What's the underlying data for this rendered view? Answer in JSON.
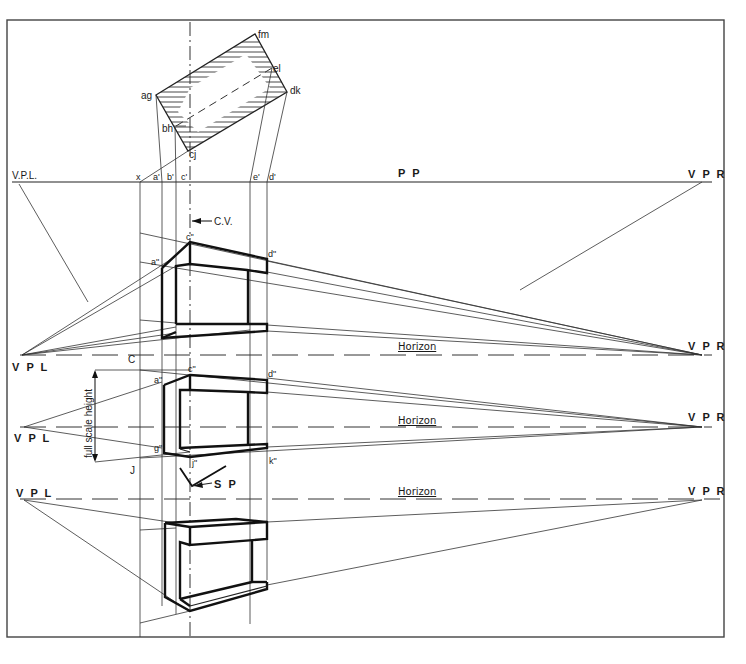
{
  "diagram": {
    "type": "two-point perspective construction drawing",
    "plan_labels": {
      "corner_ag": "ag",
      "corner_bh": "bh",
      "corner_cj": "cj",
      "corner_dk": "dk",
      "corner_el": "el",
      "corner_fm": "fm"
    },
    "picture_plane": {
      "label": "P P",
      "left_vp_label": "V.P.L.",
      "right_vp_label": "V P R",
      "ticks": [
        "x",
        "a'",
        "b'",
        "c'",
        "e'",
        "d'"
      ]
    },
    "center_of_vision": {
      "label": "C.V."
    },
    "views": [
      {
        "name": "above-horizon view",
        "horizon_label": "Horizon",
        "vpl_label": "V P L",
        "vpr_label": "V P R",
        "point_labels": [
          "c\"",
          "a\"",
          "d\""
        ],
        "side_label": "C"
      },
      {
        "name": "eye-level view",
        "horizon_label": "Horizon",
        "vpl_label": "V P L",
        "vpr_label": "V P R",
        "point_labels": [
          "c\"",
          "a\"",
          "d\"",
          "g\"",
          "j\"",
          "k\""
        ],
        "dimension_label": "full scale height",
        "side_label": "J"
      },
      {
        "name": "below-horizon view",
        "horizon_label": "Horizon",
        "vpl_label": "V P L",
        "vpr_label": "V P R"
      }
    ],
    "station_point": {
      "label": "S P"
    },
    "colors": {
      "ink": "#1a1a1a",
      "paper": "#ffffff",
      "frame": "#444444"
    }
  }
}
